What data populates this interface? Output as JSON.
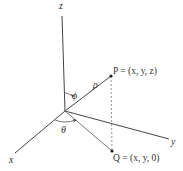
{
  "diagram": {
    "axes": {
      "x_label": "x",
      "y_label": "y",
      "z_label": "z"
    },
    "points": {
      "P_label": "P = (x, y, z)",
      "Q_label": "Q = (x, y, 0)"
    },
    "symbols": {
      "rho": "ρ",
      "phi": "ϕ",
      "theta": "θ"
    },
    "colors": {
      "line": "#333333",
      "dashed": "#666666",
      "background": "#ffffff"
    }
  }
}
